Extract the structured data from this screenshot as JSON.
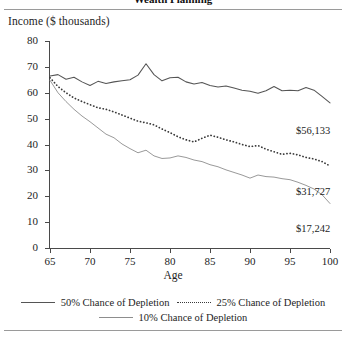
{
  "header": {
    "title": "Wealth Planning",
    "title_clipped": true
  },
  "axes": {
    "y_caption": "Income ($ thousands)",
    "x_caption": "Age",
    "y_ticks": [
      0,
      10,
      20,
      30,
      40,
      50,
      60,
      70,
      80
    ],
    "x_ticks": [
      65,
      70,
      75,
      80,
      85,
      90,
      95,
      100
    ]
  },
  "end_labels": [
    {
      "name": "label-50pct",
      "text": "$56,133"
    },
    {
      "name": "label-25pct",
      "text": "$31,727"
    },
    {
      "name": "label-10pct",
      "text": "$17,242"
    }
  ],
  "legend": {
    "row1": [
      {
        "label": "50% Chance of Depletion",
        "style": "solid",
        "color": "#555555"
      },
      {
        "label": "25% Chance of Depletion",
        "style": "dotted",
        "color": "#3a3a3a"
      }
    ],
    "row2": [
      {
        "label": "10% Chance of Depletion",
        "style": "solid-light",
        "color": "#8d8d8d"
      }
    ]
  },
  "chart_data": {
    "type": "line",
    "title": "Wealth Planning",
    "xlabel": "Age",
    "ylabel": "Income ($ thousands)",
    "xlim": [
      65,
      100
    ],
    "ylim": [
      0,
      80
    ],
    "grid": false,
    "legend_position": "bottom",
    "x": [
      65,
      66,
      67,
      68,
      69,
      70,
      71,
      72,
      73,
      74,
      75,
      76,
      77,
      78,
      79,
      80,
      81,
      82,
      83,
      84,
      85,
      86,
      87,
      88,
      89,
      90,
      91,
      92,
      93,
      94,
      95,
      96,
      97,
      98,
      99,
      100
    ],
    "series": [
      {
        "name": "50% Chance of Depletion",
        "style": "solid",
        "color": "#555555",
        "end_value_label": "$56,133",
        "end_value": 56.133,
        "values": [
          66.5,
          67.0,
          65.2,
          66.0,
          64.2,
          62.8,
          64.4,
          63.6,
          64.2,
          64.6,
          65.0,
          66.8,
          71.2,
          67.0,
          64.6,
          65.8,
          66.0,
          64.2,
          63.4,
          64.0,
          62.8,
          62.2,
          62.6,
          61.8,
          61.0,
          60.6,
          59.8,
          60.8,
          62.4,
          60.8,
          61.0,
          60.8,
          62.0,
          61.0,
          58.6,
          56.1
        ]
      },
      {
        "name": "25% Chance of Depletion",
        "style": "dotted",
        "color": "#3a3a3a",
        "end_value_label": "$31,727",
        "end_value": 31.727,
        "values": [
          65.8,
          62.4,
          60.0,
          58.0,
          56.6,
          55.4,
          54.2,
          53.6,
          52.6,
          51.4,
          50.2,
          49.0,
          48.4,
          47.6,
          46.0,
          44.6,
          43.0,
          41.8,
          41.0,
          42.4,
          43.6,
          42.8,
          41.8,
          41.0,
          40.0,
          39.2,
          39.6,
          38.2,
          37.2,
          36.2,
          36.6,
          36.0,
          35.0,
          34.4,
          33.4,
          31.7
        ]
      },
      {
        "name": "10% Chance of Depletion",
        "style": "solid-light",
        "color": "#8d8d8d",
        "end_value_label": "$17,242",
        "end_value": 17.242,
        "values": [
          64.8,
          60.0,
          56.6,
          53.6,
          51.0,
          48.8,
          46.4,
          44.0,
          42.6,
          40.2,
          38.4,
          36.8,
          37.8,
          35.6,
          34.6,
          34.8,
          35.6,
          35.0,
          34.0,
          33.4,
          32.2,
          31.4,
          30.2,
          29.2,
          28.2,
          27.0,
          28.2,
          27.6,
          27.4,
          26.8,
          26.4,
          25.4,
          24.2,
          22.8,
          20.6,
          17.2
        ]
      }
    ]
  }
}
